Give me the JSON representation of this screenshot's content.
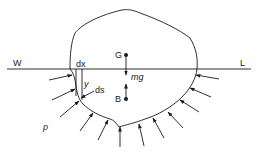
{
  "diagram": {
    "type": "floating-body-hydrostatics",
    "colors": {
      "ink": "#1a1a1a",
      "background": "#ffffff"
    },
    "waterline": {
      "left_label": "W",
      "right_label": "L"
    },
    "points": {
      "center_of_gravity": "G",
      "center_of_buoyancy": "B"
    },
    "force_label": "mg",
    "element_labels": {
      "width": "dx",
      "depth": "y",
      "surface_element": "ds"
    },
    "pressure_label": "p",
    "pressure_arrow_count": 15
  }
}
